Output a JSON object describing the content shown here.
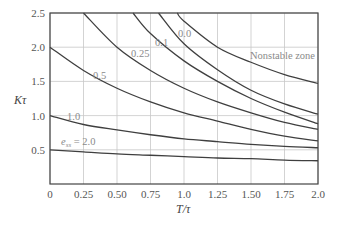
{
  "chart_data": {
    "type": "line",
    "title": "",
    "xlabel": "T/τ",
    "ylabel": "Kτ",
    "xlim": [
      0,
      2.0
    ],
    "ylim": [
      0,
      2.5
    ],
    "grid": true,
    "xticks": [
      "0",
      "0.25",
      "0.50",
      "0.75",
      "1.0",
      "1.25",
      "1.50",
      "1.75",
      "2.0"
    ],
    "yticks": [
      "0.5",
      "1.0",
      "1.5",
      "2.0",
      "2.5"
    ],
    "annotations": [
      {
        "text": "Nonstable zone",
        "x": 1.55,
        "y": 1.72
      },
      {
        "text": "e_ss = 2.0",
        "x": 0.2,
        "y": 0.6
      }
    ],
    "series": [
      {
        "name": "2.0",
        "label": "e_ss = 2.0",
        "x": [
          0,
          0.25,
          0.5,
          0.75,
          1.0,
          1.25,
          1.5,
          1.75,
          2.0
        ],
        "values": [
          0.5,
          0.47,
          0.44,
          0.42,
          0.4,
          0.38,
          0.37,
          0.35,
          0.34
        ]
      },
      {
        "name": "1.0",
        "label": "1.0",
        "x": [
          0,
          0.25,
          0.5,
          0.75,
          1.0,
          1.25,
          1.5,
          1.75,
          2.0
        ],
        "values": [
          1.0,
          0.87,
          0.79,
          0.72,
          0.66,
          0.62,
          0.58,
          0.55,
          0.53
        ]
      },
      {
        "name": "0.5",
        "label": "0.5",
        "x": [
          0,
          0.25,
          0.5,
          0.75,
          1.0,
          1.25,
          1.5,
          1.75,
          2.0
        ],
        "values": [
          2.0,
          1.66,
          1.4,
          1.2,
          1.04,
          0.92,
          0.8,
          0.7,
          0.63
        ]
      },
      {
        "name": "0.25",
        "label": "0.25",
        "x": [
          0.25,
          0.5,
          0.75,
          1.0,
          1.25,
          1.5,
          1.75,
          2.0
        ],
        "values": [
          2.5,
          2.0,
          1.66,
          1.4,
          1.2,
          1.04,
          0.9,
          0.8
        ]
      },
      {
        "name": "0.1",
        "label": "0.1",
        "x": [
          0.62,
          0.75,
          1.0,
          1.25,
          1.5,
          1.75,
          2.0
        ],
        "values": [
          2.5,
          2.2,
          1.8,
          1.5,
          1.25,
          1.05,
          0.88
        ]
      },
      {
        "name": "0.0",
        "label": "0.0",
        "x": [
          0.81,
          1.0,
          1.25,
          1.5,
          1.75,
          2.0
        ],
        "values": [
          2.5,
          2.05,
          1.67,
          1.37,
          1.17,
          1.02
        ]
      },
      {
        "name": "stability-boundary",
        "label": "",
        "x": [
          0.95,
          1.0,
          1.25,
          1.5,
          1.75,
          2.0
        ],
        "values": [
          2.5,
          2.38,
          2.0,
          1.78,
          1.6,
          1.47
        ]
      }
    ]
  },
  "labels": {
    "nonstable": "Nonstable zone",
    "ess_prefix": "e",
    "ess_sub": "ss",
    "ess_value": " = 2.0",
    "l10": "1.0",
    "l05": "0.5",
    "l025": "0.25",
    "l01": "0.1",
    "l00": "0.0",
    "xlabel": "T/τ",
    "ylabel": "Kτ"
  }
}
